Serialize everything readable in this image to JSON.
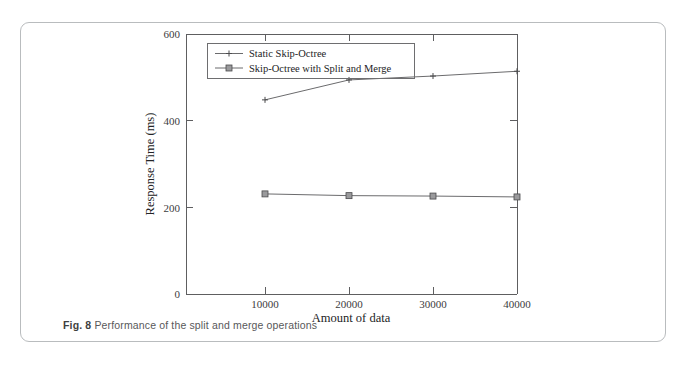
{
  "figure": {
    "caption_label": "Fig. 8",
    "caption_text": "Performance of the split and merge operations"
  },
  "chart_data": {
    "type": "line",
    "title": "",
    "xlabel": "Amount of data",
    "ylabel": "Response Time (ms)",
    "x": [
      10000,
      20000,
      30000,
      40000
    ],
    "xticklabels": [
      "10000",
      "20000",
      "30000",
      "40000"
    ],
    "yticks": [
      0,
      200,
      400,
      600
    ],
    "yticklabels": [
      "0",
      "200",
      "400",
      "600"
    ],
    "xlim": [
      0,
      44000
    ],
    "ylim": [
      0,
      600
    ],
    "grid": false,
    "legend_position": "upper-left",
    "series": [
      {
        "name": "Static Skip-Octree",
        "marker": "plus",
        "values": [
          448,
          494,
          503,
          514
        ]
      },
      {
        "name": "Skip-Octree with Split and Merge",
        "marker": "square",
        "values": [
          231,
          227,
          226,
          224
        ]
      }
    ]
  }
}
